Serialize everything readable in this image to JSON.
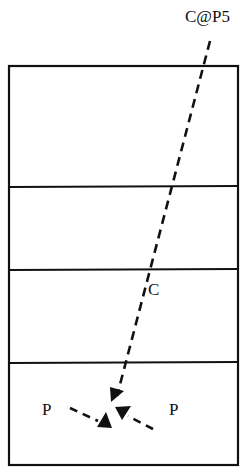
{
  "diagram": {
    "type": "court-play-diagram",
    "labels": {
      "top_label": "C@P5",
      "middle_label": "C",
      "left_player": "P",
      "right_player": "P"
    },
    "court": {
      "zones": 4,
      "stroke_color": "#111111"
    },
    "paths": [
      {
        "name": "C@P5 to center",
        "style": "dashed",
        "arrow": "end"
      },
      {
        "name": "left P to center",
        "style": "dashed",
        "arrow": "end"
      },
      {
        "name": "right P to center",
        "style": "dashed",
        "arrow": "end"
      }
    ]
  }
}
